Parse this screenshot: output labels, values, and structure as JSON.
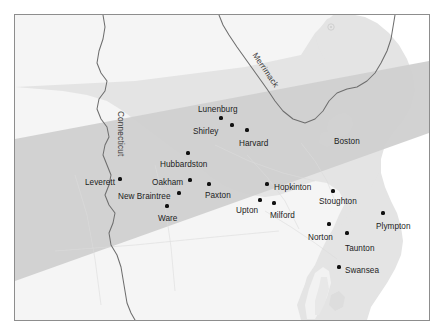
{
  "figure": {
    "kind": "reference-map",
    "region": "Eastern Massachusetts and vicinity",
    "background_color": "#ffffff",
    "frame_border_color": "#8d8d8d",
    "land_color": "#e3e3e3",
    "inland_base_color": "#f4f4f4",
    "highlight_band_color": "#cfcfcf",
    "river_line_color": "#6e6e6e",
    "marker_color": "#111111",
    "label_color": "#1c1c1c"
  },
  "map": {
    "places": [
      {
        "name": "Lunenburg",
        "label_x": 197,
        "label_y": 105,
        "dot_x": 220,
        "dot_y": 117,
        "anchor": "left"
      },
      {
        "name": "Shirley",
        "label_x": 192,
        "label_y": 127,
        "dot_x": 231,
        "dot_y": 124,
        "anchor": "left"
      },
      {
        "name": "Harvard",
        "label_x": 238,
        "label_y": 139,
        "dot_x": 246,
        "dot_y": 129,
        "anchor": "left"
      },
      {
        "name": "Boston",
        "label_x": 333,
        "label_y": 137,
        "dot_x": null,
        "dot_y": null,
        "anchor": "left"
      },
      {
        "name": "Hubbardston",
        "label_x": 159,
        "label_y": 160,
        "dot_x": 187,
        "dot_y": 152,
        "anchor": "left"
      },
      {
        "name": "Leverett",
        "label_x": 84,
        "label_y": 178,
        "dot_x": 119,
        "dot_y": 178,
        "anchor": "left"
      },
      {
        "name": "Oakham",
        "label_x": 151,
        "label_y": 178,
        "dot_x": 189,
        "dot_y": 179,
        "anchor": "left"
      },
      {
        "name": "New Braintree",
        "label_x": 117,
        "label_y": 192,
        "dot_x": 178,
        "dot_y": 192,
        "anchor": "left"
      },
      {
        "name": "Paxton",
        "label_x": 204,
        "label_y": 191,
        "dot_x": 208,
        "dot_y": 183,
        "anchor": "left"
      },
      {
        "name": "Hopkinton",
        "label_x": 273,
        "label_y": 183,
        "dot_x": 266,
        "dot_y": 183,
        "anchor": "left"
      },
      {
        "name": "Upton",
        "label_x": 235,
        "label_y": 206,
        "dot_x": 259,
        "dot_y": 199,
        "anchor": "left"
      },
      {
        "name": "Milford",
        "label_x": 269,
        "label_y": 211,
        "dot_x": 273,
        "dot_y": 202,
        "anchor": "left"
      },
      {
        "name": "Stoughton",
        "label_x": 318,
        "label_y": 197,
        "dot_x": 332,
        "dot_y": 190,
        "anchor": "left"
      },
      {
        "name": "Ware",
        "label_x": 157,
        "label_y": 214,
        "dot_x": 166,
        "dot_y": 205,
        "anchor": "left"
      },
      {
        "name": "Plympton",
        "label_x": 375,
        "label_y": 222,
        "dot_x": 382,
        "dot_y": 212,
        "anchor": "left"
      },
      {
        "name": "Norton",
        "label_x": 307,
        "label_y": 233,
        "dot_x": 328,
        "dot_y": 223,
        "anchor": "left"
      },
      {
        "name": "Taunton",
        "label_x": 344,
        "label_y": 244,
        "dot_x": 346,
        "dot_y": 232,
        "anchor": "left"
      },
      {
        "name": "Swansea",
        "label_x": 344,
        "label_y": 266,
        "dot_x": 338,
        "dot_y": 266,
        "anchor": "left"
      }
    ],
    "rivers": [
      {
        "name": "Connecticut",
        "orientation": "vertical-down"
      },
      {
        "name": "Merrimack",
        "orientation": "diagonal-down-right"
      }
    ]
  }
}
